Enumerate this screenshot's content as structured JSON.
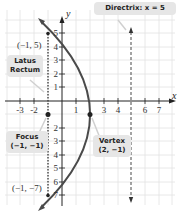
{
  "figure": {
    "axes": {
      "x_label": "x",
      "y_label": "y",
      "x_ticks": [
        "-3",
        "-2",
        "1",
        "3",
        "4",
        "6",
        "7"
      ],
      "y_ticks": [
        "5",
        "4",
        "3",
        "2",
        "1",
        "2",
        "3",
        "4",
        "5",
        "6",
        "7"
      ],
      "y_ticks_values": [
        5,
        4,
        3,
        2,
        1,
        -2,
        -3,
        -4,
        -5,
        -6,
        -7
      ]
    },
    "callouts": {
      "directrix": "Directrix: x = 5",
      "latus_rectum_line1": "Latus",
      "latus_rectum_line2": "Rectum",
      "focus_line1": "Focus",
      "focus_line2": "(−1, −1)",
      "vertex_line1": "Vertex",
      "vertex_line2": "(2, −1)"
    },
    "point_labels": {
      "top_endpoint": "(−1, 5)",
      "bottom_endpoint": "(−1, −7)"
    },
    "colors": {
      "parabola": "#4a4a4a",
      "grid": "#e2e2e2",
      "axis": "#222222",
      "callout_bg": "#e6e6e6"
    }
  }
}
